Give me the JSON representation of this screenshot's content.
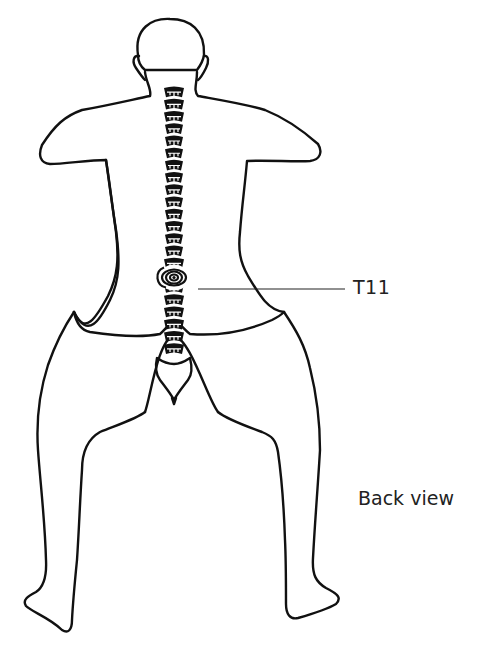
{
  "figure": {
    "highlighted_vertebra": "T11",
    "labels": {
      "vertebra": "T11",
      "view": "Back view"
    },
    "colors": {
      "line": "#111111",
      "background": "#ffffff",
      "text": "#222222"
    },
    "spine": {
      "vertebra_count": 22,
      "highlight_index": 15
    }
  }
}
